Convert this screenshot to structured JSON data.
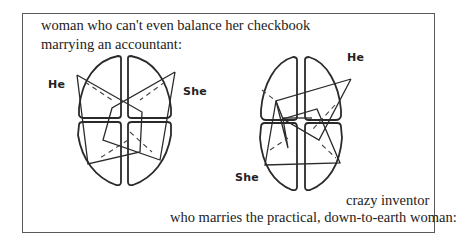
{
  "figure": {
    "caption_top_line1": "woman who can't even balance her checkbook",
    "caption_top_line2": "marrying an accountant:",
    "caption_bottom_line1": "crazy inventor",
    "caption_bottom_line2": "who marries the practical, down-to-earth woman:"
  },
  "left_diagram": {
    "label_he": "He",
    "label_she": "She",
    "description": "Four-quadrant brain dominance shapes with two overlapping profiles (He, She) on opposite sides"
  },
  "right_diagram": {
    "label_he": "He",
    "label_she": "She",
    "description": "Four-quadrant brain dominance shapes with He profile upper-right and She profile lower-left"
  },
  "colors": {
    "ink": "#2a2a2a",
    "frame": "#5a5a5a",
    "background": "#ffffff"
  }
}
